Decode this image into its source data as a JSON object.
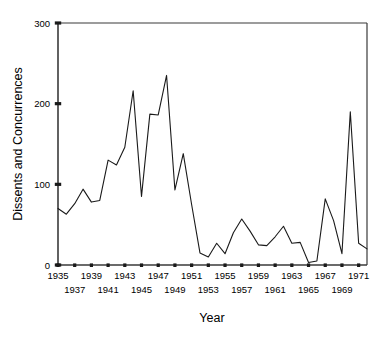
{
  "chart_data": {
    "type": "line",
    "title": "",
    "xlabel": "Year",
    "ylabel": "Dissents and Concurrences",
    "xlim": [
      1935,
      1972
    ],
    "ylim": [
      0,
      300
    ],
    "grid": false,
    "legend": null,
    "y_ticks": [
      0,
      100,
      200,
      300
    ],
    "y_tick_labels": [
      "0",
      "100",
      "200",
      "300"
    ],
    "x_ticks": [
      1935,
      1937,
      1939,
      1941,
      1943,
      1945,
      1947,
      1949,
      1951,
      1953,
      1955,
      1957,
      1959,
      1961,
      1963,
      1965,
      1967,
      1969,
      1971
    ],
    "x_tick_labels_top_row": [
      "1935",
      "1939",
      "1943",
      "1947",
      "1951",
      "1955",
      "1959",
      "1963",
      "1967",
      "1971"
    ],
    "x_tick_labels_bottom_row": [
      "1937",
      "1941",
      "1945",
      "1949",
      "1953",
      "1957",
      "1961",
      "1965",
      "1969"
    ],
    "x": [
      1935,
      1936,
      1937,
      1938,
      1939,
      1940,
      1941,
      1942,
      1943,
      1944,
      1945,
      1946,
      1947,
      1948,
      1949,
      1950,
      1951,
      1952,
      1953,
      1954,
      1955,
      1956,
      1957,
      1958,
      1959,
      1960,
      1961,
      1962,
      1963,
      1964,
      1965,
      1966,
      1967,
      1968,
      1969,
      1970,
      1971,
      1972
    ],
    "values": [
      70,
      63,
      76,
      94,
      78,
      80,
      130,
      124,
      146,
      216,
      85,
      187,
      186,
      235,
      93,
      138,
      75,
      15,
      10,
      27,
      14,
      40,
      57,
      42,
      25,
      24,
      35,
      48,
      27,
      28,
      3,
      5,
      82,
      55,
      14,
      190,
      27,
      20
    ],
    "series": [
      {
        "name": "Dissents and Concurrences",
        "values": [
          70,
          63,
          76,
          94,
          78,
          80,
          130,
          124,
          146,
          216,
          85,
          187,
          186,
          235,
          93,
          138,
          75,
          15,
          10,
          27,
          14,
          40,
          57,
          42,
          25,
          24,
          35,
          48,
          27,
          28,
          3,
          5,
          82,
          55,
          14,
          190,
          27,
          20
        ],
        "color": "#1a1a1a"
      }
    ],
    "line_color": "#1a1a1a",
    "axis_color": "#3a3a3a",
    "background": "#ffffff"
  },
  "axes": {
    "y_axis_title": "Dissents and Concurrences",
    "x_axis_title": "Year"
  }
}
